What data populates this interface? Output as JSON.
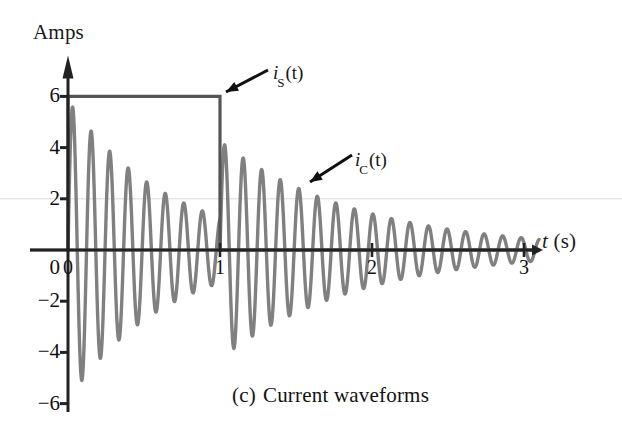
{
  "figure": {
    "caption_index": "(c)",
    "caption_text": "Current waveforms",
    "y_axis_title": "Amps",
    "x_axis_symbol": "t",
    "x_axis_unit": "(s)"
  },
  "labels": {
    "source_current": {
      "symbol": "i",
      "subscript": "S",
      "arg": "(t)"
    },
    "capacitor_current": {
      "symbol": "i",
      "subscript": "C",
      "arg": "(t)"
    }
  },
  "colors": {
    "axis": "#222222",
    "source_curve": "#555555",
    "capacitor_curve": "#808080",
    "background": "#ffffff",
    "text": "#111111"
  },
  "chart_data": {
    "type": "line",
    "xlabel": "t (s)",
    "ylabel": "Amps",
    "xlim": [
      0,
      3.1
    ],
    "ylim": [
      -6.4,
      6.6
    ],
    "grid": false,
    "legend": "inline-annotations",
    "xticks": [
      0,
      1,
      2,
      3
    ],
    "xtick_labels": [
      "0",
      "1",
      "2",
      "3"
    ],
    "yticks": [
      -6,
      -4,
      -2,
      0,
      2,
      4,
      6
    ],
    "ytick_labels": [
      "-6",
      "-4",
      "-2",
      "0",
      "2",
      "4",
      "6"
    ],
    "series": [
      {
        "name": "i_S(t)",
        "description": "Rectangular source current pulse: 6 A from t=0 to t=1 s, then 0 A",
        "type": "step",
        "color": "#555555",
        "points": [
          {
            "t": 0.0,
            "i": 0
          },
          {
            "t": 0.0,
            "i": 6
          },
          {
            "t": 1.0,
            "i": 6
          },
          {
            "t": 1.0,
            "i": 0
          },
          {
            "t": 3.1,
            "i": 0
          }
        ]
      },
      {
        "name": "i_C(t)",
        "description": "Damped sinusoidal capacitor current; amplitude decays exponentially, restarts with a step at t=1 s",
        "type": "damped-sinusoid",
        "color": "#808080",
        "frequency_hz": 8.2,
        "segments": [
          {
            "t_start": 0.0,
            "t_end": 1.0,
            "amplitude_start": 5.85,
            "decay_per_second": 1.52,
            "phase_deg": -90
          },
          {
            "t_start": 1.0,
            "t_end": 3.1,
            "amplitude_start": 4.25,
            "decay_per_second": 1.1,
            "phase_deg": -90
          }
        ],
        "peak_samples": [
          {
            "t": 0.06,
            "i": 5.3
          },
          {
            "t": 0.19,
            "i": 4.7
          },
          {
            "t": 0.31,
            "i": 4.1
          },
          {
            "t": 0.43,
            "i": 3.6
          },
          {
            "t": 0.55,
            "i": 3.2
          },
          {
            "t": 0.67,
            "i": 2.8
          },
          {
            "t": 0.79,
            "i": 2.5
          },
          {
            "t": 0.92,
            "i": 2.2
          },
          {
            "t": 1.06,
            "i": 4.0
          },
          {
            "t": 1.18,
            "i": 3.5
          },
          {
            "t": 1.31,
            "i": 3.1
          },
          {
            "t": 1.43,
            "i": 2.7
          },
          {
            "t": 1.55,
            "i": 2.4
          },
          {
            "t": 1.68,
            "i": 2.1
          },
          {
            "t": 1.8,
            "i": 1.9
          },
          {
            "t": 1.92,
            "i": 1.6
          },
          {
            "t": 2.05,
            "i": 1.4
          },
          {
            "t": 2.17,
            "i": 1.2
          },
          {
            "t": 2.3,
            "i": 1.1
          },
          {
            "t": 2.42,
            "i": 0.9
          },
          {
            "t": 2.54,
            "i": 0.8
          },
          {
            "t": 2.67,
            "i": 0.7
          },
          {
            "t": 2.79,
            "i": 0.6
          },
          {
            "t": 2.92,
            "i": 0.5
          }
        ],
        "trough_samples": [
          {
            "t": 0.0,
            "i": -5.85
          },
          {
            "t": 0.12,
            "i": -5.1
          },
          {
            "t": 0.25,
            "i": -4.4
          },
          {
            "t": 0.37,
            "i": -3.9
          },
          {
            "t": 0.49,
            "i": -3.4
          },
          {
            "t": 0.61,
            "i": -3.0
          },
          {
            "t": 0.74,
            "i": -2.6
          },
          {
            "t": 0.86,
            "i": -2.3
          },
          {
            "t": 0.98,
            "i": -2.0
          },
          {
            "t": 1.0,
            "i": -4.25
          },
          {
            "t": 1.12,
            "i": -3.7
          },
          {
            "t": 1.25,
            "i": -3.3
          },
          {
            "t": 1.37,
            "i": -2.9
          },
          {
            "t": 1.49,
            "i": -2.5
          },
          {
            "t": 1.61,
            "i": -2.2
          },
          {
            "t": 1.74,
            "i": -2.0
          },
          {
            "t": 1.86,
            "i": -1.7
          },
          {
            "t": 1.99,
            "i": -1.5
          },
          {
            "t": 2.11,
            "i": -1.3
          },
          {
            "t": 2.23,
            "i": -1.1
          },
          {
            "t": 2.36,
            "i": -1.0
          },
          {
            "t": 2.48,
            "i": -0.9
          },
          {
            "t": 2.6,
            "i": -0.75
          },
          {
            "t": 2.73,
            "i": -0.65
          },
          {
            "t": 2.85,
            "i": -0.55
          },
          {
            "t": 2.98,
            "i": -0.5
          }
        ]
      }
    ],
    "annotations": [
      {
        "text": "i_S(t)",
        "points_to_t": 1.0,
        "points_to_i": 6.0
      },
      {
        "text": "i_C(t)",
        "points_to_t": 1.55,
        "points_to_i": 2.45
      }
    ]
  }
}
